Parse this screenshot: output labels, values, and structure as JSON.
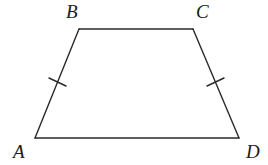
{
  "figure": {
    "type": "isosceles-trapezoid",
    "stroke_color": "#2a2a2a",
    "background": "#ffffff",
    "vertices": {
      "A": {
        "label": "A",
        "x": 35,
        "y": 138
      },
      "B": {
        "label": "B",
        "x": 79,
        "y": 29
      },
      "C": {
        "label": "C",
        "x": 193,
        "y": 29
      },
      "D": {
        "label": "D",
        "x": 239,
        "y": 138
      }
    },
    "sides": [
      "AB",
      "BC",
      "CD",
      "DA"
    ],
    "equal_marks": [
      {
        "side": "AB",
        "ticks": 1
      },
      {
        "side": "CD",
        "ticks": 1
      }
    ]
  }
}
